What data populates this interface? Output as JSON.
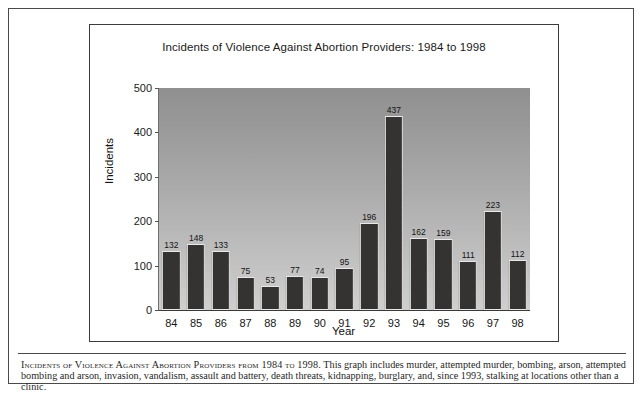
{
  "figure": {
    "caption_lead": "Incidents of Violence Against Abortion Providers from 1984 to 1998.",
    "caption_body": " This graph includes murder, attempted murder, bombing, arson, attempted bombing and arson, invasion, vandalism, assault and battery, death threats, kidnapping, burglary, and, since 1993, stalking at locations other than a clinic."
  },
  "chart_data": {
    "type": "bar",
    "title": "Incidents of Violence Against Abortion Providers: 1984 to 1998",
    "xlabel": "Year",
    "ylabel": "Incidents",
    "categories": [
      "84",
      "85",
      "86",
      "87",
      "88",
      "89",
      "90",
      "91",
      "92",
      "93",
      "94",
      "95",
      "96",
      "97",
      "98"
    ],
    "values": [
      132,
      148,
      133,
      75,
      53,
      77,
      74,
      95,
      196,
      437,
      162,
      159,
      111,
      223,
      112
    ],
    "ylim": [
      0,
      500
    ],
    "yticks": [
      0,
      100,
      200,
      300,
      400,
      500
    ],
    "ytick_labels": [
      "0",
      "100",
      "200",
      "300",
      "400",
      "500"
    ],
    "grid": false,
    "legend": false,
    "data_labels": true,
    "bar_color": "#353332",
    "plot_bg_top": "#8f8f8f",
    "plot_bg_bottom": "#cfcfcf"
  }
}
